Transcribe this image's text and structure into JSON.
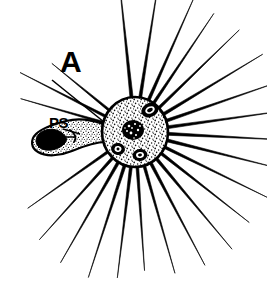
{
  "figure": {
    "kind": "scientific-line-drawing",
    "background_color": "#ffffff",
    "ink_color": "#000000",
    "width": 267,
    "height": 284
  },
  "labels": {
    "panel": {
      "text": "A",
      "x": 60,
      "y": 72,
      "leader_line": {
        "x1": 52,
        "y1": 80,
        "x2": 104,
        "y2": 122
      }
    },
    "part": {
      "text": "PS",
      "x": 49,
      "y": 128,
      "leader_line": {
        "x1": 62,
        "y1": 129,
        "x2": 78,
        "y2": 133
      }
    }
  },
  "cell_body": {
    "name": "cell-body",
    "center_x": 135,
    "center_y": 132,
    "radius_x": 33,
    "radius_y": 35,
    "fill": "#ffffff",
    "stroke": "#000000",
    "stroke_width": 2.5,
    "texture": "stipple"
  },
  "nucleus": {
    "name": "nucleus",
    "center_x": 133,
    "center_y": 130,
    "radius_x": 11,
    "radius_y": 10,
    "fill": "#000000"
  },
  "vacuoles": [
    {
      "name": "vacuole-upper-right",
      "cx": 150,
      "cy": 110,
      "rx": 9,
      "ry": 7,
      "rotate": -25,
      "inner_rx": 5,
      "inner_ry": 3.5
    },
    {
      "name": "vacuole-lower-left",
      "cx": 118,
      "cy": 149,
      "rx": 7,
      "ry": 6,
      "rotate": 10,
      "inner_rx": 3.5,
      "inner_ry": 3
    },
    {
      "name": "vacuole-lower-center",
      "cx": 140,
      "cy": 155,
      "rx": 7.5,
      "ry": 6,
      "rotate": -10,
      "inner_rx": 4,
      "inner_ry": 3
    }
  ],
  "pseudopodium": {
    "name": "pseudopodium",
    "outline_path": "M 103 124 C 92 120, 78 118, 66 121 C 54 124, 42 128, 36 134 C 30 140, 31 148, 38 152 C 46 157, 60 156, 72 151 C 84 146, 96 142, 106 142 Z",
    "prey_blob": {
      "name": "ingested-prey",
      "path": "M 62 133 C 56 128, 46 128, 40 133 C 34 138, 35 146, 42 149 C 50 152, 60 149, 65 143 C 68 139, 66 136, 62 133 Z",
      "fill": "#000000"
    },
    "inner_marks": [
      {
        "path": "M 70 131 C 74 133, 76 137, 74 141"
      },
      {
        "path": "M 66 137 L 74 137"
      }
    ]
  },
  "axopodia": {
    "name": "axopodia-spines",
    "count": 24,
    "stroke": "#000000",
    "description": "radiating straight tapering spines from the cell body",
    "spokes": [
      {
        "angle": -96,
        "length": 124,
        "width": 3.4
      },
      {
        "angle": -81,
        "length": 122,
        "width": 3.2
      },
      {
        "angle": -66,
        "length": 114,
        "width": 3.2
      },
      {
        "angle": -56,
        "length": 108,
        "width": 3.0
      },
      {
        "angle": -44,
        "length": 112,
        "width": 3.0
      },
      {
        "angle": -31,
        "length": 116,
        "width": 3.2
      },
      {
        "angle": -19,
        "length": 120,
        "width": 3.2
      },
      {
        "angle": -8,
        "length": 122,
        "width": 3.2
      },
      {
        "angle": 3,
        "length": 120,
        "width": 3.2
      },
      {
        "angle": 14,
        "length": 118,
        "width": 3.2
      },
      {
        "angle": 26,
        "length": 114,
        "width": 3.0
      },
      {
        "angle": 38,
        "length": 112,
        "width": 3.0
      },
      {
        "angle": 50,
        "length": 118,
        "width": 3.2
      },
      {
        "angle": 62,
        "length": 116,
        "width": 3.2
      },
      {
        "angle": 74,
        "length": 112,
        "width": 3.0
      },
      {
        "angle": 86,
        "length": 104,
        "width": 3.0
      },
      {
        "angle": 97,
        "length": 112,
        "width": 3.2
      },
      {
        "angle": 108,
        "length": 118,
        "width": 3.2
      },
      {
        "angle": 120,
        "length": 116,
        "width": 3.2
      },
      {
        "angle": 132,
        "length": 110,
        "width": 3.0
      },
      {
        "angle": 145,
        "length": 98,
        "width": 2.8
      },
      {
        "angle": 196,
        "length": 86,
        "width": 2.6
      },
      {
        "angle": 207,
        "length": 96,
        "width": 2.8
      },
      {
        "angle": 219,
        "length": 74,
        "width": 2.6
      }
    ]
  }
}
